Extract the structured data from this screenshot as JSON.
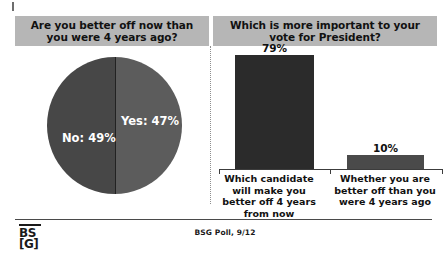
{
  "slide": {
    "background_color": "#ffffff",
    "banner_color": "#b6b6b6",
    "source_note": "BSG Poll, 9/12",
    "logo": {
      "name": "bsg-logo",
      "top_text": "BS",
      "bottom_text": "[G]"
    }
  },
  "panels": {
    "left": {
      "title": "Are you better off now than you were 4 years ago?"
    },
    "right": {
      "title": "Which is more important to your vote for President?"
    }
  },
  "chart_data": [
    {
      "type": "pie",
      "title": "Are you better off now than you were 4 years ago?",
      "labels": [
        "No",
        "Yes"
      ],
      "values": [
        49,
        47
      ],
      "value_unit": "%",
      "slice_labels": [
        "No: 49%",
        "Yes: 47%"
      ],
      "colors": [
        "#474747",
        "#5c5c5c"
      ],
      "legend": "none",
      "grid": false
    },
    {
      "type": "bar",
      "title": "Which is more important to your vote for President?",
      "categories": [
        "Which candidate will make you better off 4 years from now",
        "Whether you are better off than you were 4 years ago"
      ],
      "values": [
        79,
        10
      ],
      "value_labels": [
        "79%",
        "10%"
      ],
      "colors": [
        "#2b2b2b",
        "#4a4a4a"
      ],
      "xlabel": "",
      "ylabel": "",
      "ylim": [
        0,
        83
      ],
      "grid": false,
      "legend": "none"
    }
  ]
}
